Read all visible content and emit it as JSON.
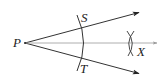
{
  "diagram": {
    "colors": {
      "stroke": "#333333",
      "bisector": "#888888",
      "label": "#222222"
    },
    "points": {
      "P": {
        "label": "P",
        "x": 25,
        "y": 43
      },
      "S": {
        "label": "S",
        "x": 81,
        "y": 26
      },
      "T": {
        "label": "T",
        "x": 81,
        "y": 60
      },
      "X": {
        "label": "X",
        "x": 131,
        "y": 43
      }
    },
    "rays": [
      {
        "name": "ray-PS",
        "from": "P",
        "to": [
          140,
          12
        ],
        "arrow": true
      },
      {
        "name": "ray-PT",
        "from": "P",
        "to": [
          140,
          74
        ],
        "arrow": true
      },
      {
        "name": "ray-PX",
        "from": "P",
        "to": [
          158,
          43
        ],
        "arrow": true,
        "style": "bisector"
      }
    ],
    "labels": {
      "P": "P",
      "S": "S",
      "T": "T",
      "X": "X"
    }
  }
}
